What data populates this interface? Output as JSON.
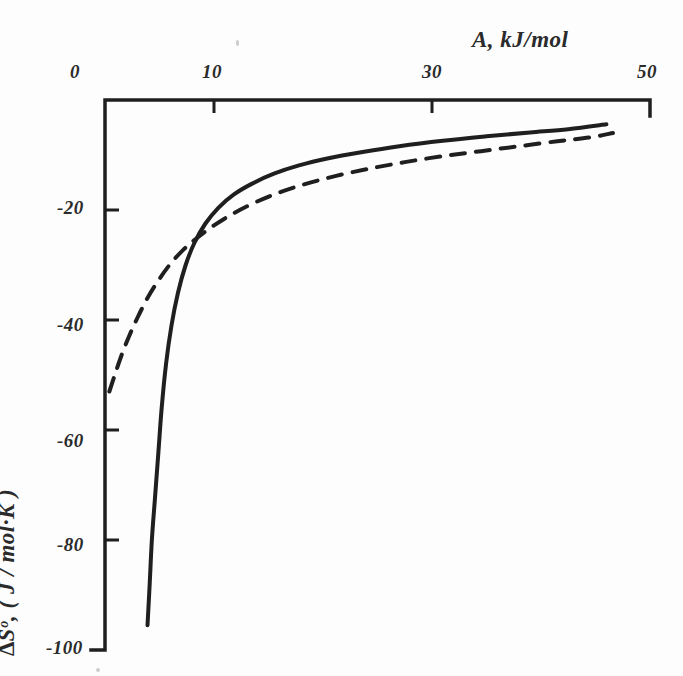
{
  "figure": {
    "background_color": "#fdfdfd",
    "ink_color": "#1f1f1f",
    "label_color": "#2b2b2b"
  },
  "axes": {
    "x_axis": {
      "title": "A, kJ/mol",
      "position": "top",
      "tick_labels": [
        "0",
        "10",
        "30",
        "50"
      ],
      "tick_values": [
        0,
        10,
        30,
        50
      ],
      "range": [
        0,
        50
      ],
      "pixel_left": 105,
      "pixel_right": 650
    },
    "y_axis": {
      "title": "∆Sᵒ, ( J / mol·K )",
      "position": "left",
      "tick_labels": [
        "-20",
        "-40",
        "-60",
        "-80",
        "-100"
      ],
      "tick_values": [
        -20,
        -40,
        -60,
        -80,
        -100
      ],
      "range": [
        -100,
        0
      ],
      "pixel_top": 100,
      "pixel_bottom": 650
    }
  },
  "chart_data": {
    "type": "line",
    "title": "",
    "xlabel": "A, kJ/mol",
    "ylabel": "∆Sᵒ, ( J / mol·K )",
    "xlim": [
      0,
      50
    ],
    "ylim": [
      -100,
      0
    ],
    "grid": false,
    "legend": "none",
    "series": [
      {
        "name": "solid-curve",
        "style": "solid",
        "color": "#1f1f1f",
        "linewidth": 4,
        "points": [
          [
            3.9,
            -95.5
          ],
          [
            4.1,
            -88.0
          ],
          [
            4.3,
            -80.0
          ],
          [
            4.6,
            -72.0
          ],
          [
            4.9,
            -64.0
          ],
          [
            5.2,
            -56.0
          ],
          [
            5.6,
            -48.0
          ],
          [
            6.1,
            -41.0
          ],
          [
            6.7,
            -35.0
          ],
          [
            7.4,
            -30.0
          ],
          [
            8.2,
            -26.0
          ],
          [
            9.2,
            -22.5
          ],
          [
            10.4,
            -19.6
          ],
          [
            11.8,
            -17.2
          ],
          [
            13.5,
            -15.2
          ],
          [
            15.5,
            -13.4
          ],
          [
            17.8,
            -11.9
          ],
          [
            20.5,
            -10.6
          ],
          [
            23.5,
            -9.5
          ],
          [
            27.0,
            -8.4
          ],
          [
            31.0,
            -7.4
          ],
          [
            35.0,
            -6.6
          ],
          [
            39.0,
            -5.9
          ],
          [
            42.5,
            -5.3
          ],
          [
            46.0,
            -4.4
          ]
        ]
      },
      {
        "name": "dashed-curve",
        "style": "dashed",
        "color": "#1f1f1f",
        "linewidth": 4,
        "dash_pattern": "14 11",
        "points": [
          [
            0.4,
            -53.0
          ],
          [
            0.9,
            -50.0
          ],
          [
            1.5,
            -46.5
          ],
          [
            2.2,
            -43.0
          ],
          [
            3.0,
            -39.5
          ],
          [
            3.9,
            -36.0
          ],
          [
            4.9,
            -32.8
          ],
          [
            6.0,
            -29.8
          ],
          [
            7.2,
            -27.2
          ],
          [
            8.5,
            -25.0
          ],
          [
            10.0,
            -22.8
          ],
          [
            11.8,
            -20.6
          ],
          [
            13.8,
            -18.6
          ],
          [
            16.0,
            -16.8
          ],
          [
            18.5,
            -15.2
          ],
          [
            21.2,
            -13.8
          ],
          [
            24.2,
            -12.5
          ],
          [
            27.5,
            -11.3
          ],
          [
            31.0,
            -10.2
          ],
          [
            34.5,
            -9.3
          ],
          [
            38.0,
            -8.4
          ],
          [
            41.5,
            -7.5
          ],
          [
            44.5,
            -6.8
          ],
          [
            46.6,
            -6.0
          ]
        ]
      }
    ]
  }
}
